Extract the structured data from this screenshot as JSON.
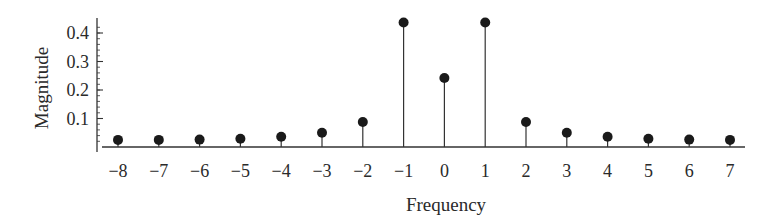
{
  "chart_data": {
    "type": "stem",
    "title": "",
    "xlabel": "Frequency",
    "ylabel": "Magnitude",
    "x": [
      -8,
      -7,
      -6,
      -5,
      -4,
      -3,
      -2,
      -1,
      0,
      1,
      2,
      3,
      4,
      5,
      6,
      7
    ],
    "values": [
      0.025,
      0.025,
      0.026,
      0.029,
      0.036,
      0.05,
      0.088,
      0.437,
      0.242,
      0.437,
      0.088,
      0.05,
      0.036,
      0.029,
      0.026,
      0.025
    ],
    "xticks": [
      -8,
      -7,
      -6,
      -5,
      -4,
      -3,
      -2,
      -1,
      0,
      1,
      2,
      3,
      4,
      5,
      6,
      7
    ],
    "xtick_labels": [
      "−8",
      "−7",
      "−6",
      "−5",
      "−4",
      "−3",
      "−2",
      "−1",
      "0",
      "1",
      "2",
      "3",
      "4",
      "5",
      "6",
      "7"
    ],
    "yticks": [
      0.1,
      0.2,
      0.3,
      0.4
    ],
    "ytick_labels": [
      "0.1",
      "0.2",
      "0.3",
      "0.4"
    ],
    "ylim": [
      0,
      0.45
    ],
    "xlim": [
      -8.5,
      7.5
    ],
    "grid": false,
    "legend": null,
    "colors": {
      "stem": "#333333",
      "marker": "#1a1a1a",
      "axis": "#333333"
    }
  }
}
